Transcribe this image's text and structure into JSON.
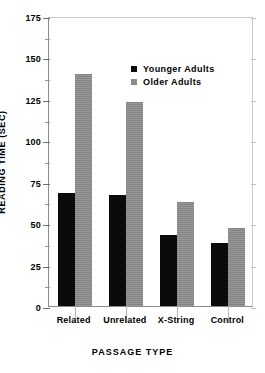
{
  "chart_data": {
    "type": "bar",
    "title": "",
    "xlabel": "PASSAGE TYPE",
    "ylabel": "READING TIME (SEC)",
    "categories": [
      "Related",
      "Unrelated",
      "X-String",
      "Control"
    ],
    "series": [
      {
        "name": "Younger Adults",
        "color": "#0b0b0b",
        "values": [
          68,
          67,
          43,
          38
        ]
      },
      {
        "name": "Older Adults",
        "color": "#8c8c8c",
        "values": [
          140,
          123,
          63,
          47
        ]
      }
    ],
    "ylim": [
      0,
      175
    ],
    "yticks": [
      0,
      25,
      50,
      75,
      100,
      125,
      150,
      175
    ],
    "ytick_labels": [
      "0",
      "25",
      "50",
      "75",
      "100",
      "125",
      "150",
      "175"
    ],
    "yticks_minor": [
      12.5,
      37.5,
      62.5,
      87.5,
      112.5,
      137.5,
      162.5
    ],
    "grid": false,
    "legend_position": "upper-center",
    "legend": [
      {
        "label": "Younger Adults",
        "swatch": "#0b0b0b"
      },
      {
        "label": "Older Adults",
        "swatch": "#8c8c8c"
      }
    ]
  }
}
